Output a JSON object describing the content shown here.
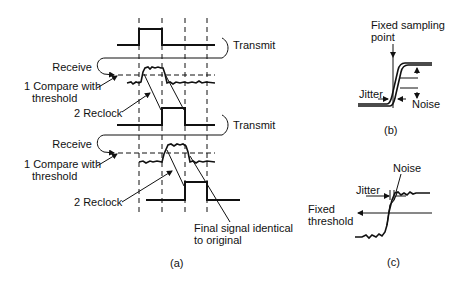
{
  "panel_a": {
    "caption": "(a)",
    "labels": {
      "transmit_1": "Transmit",
      "receive_1": "Receive",
      "compare_1_line1": "1 Compare with",
      "compare_1_line2": "threshold",
      "reclock_1": "2 Reclock",
      "transmit_2": "Transmit",
      "receive_2": "Receive",
      "compare_2_line1": "1 Compare with",
      "compare_2_line2": "threshold",
      "reclock_2": "2 Reclock",
      "final_line1": "Final signal identical",
      "final_line2": "to original"
    }
  },
  "panel_b": {
    "caption": "(b)",
    "labels": {
      "sampling_line1": "Fixed sampling",
      "sampling_line2": "point",
      "jitter": "Jitter",
      "noise": "Noise"
    }
  },
  "panel_c": {
    "caption": "(c)",
    "labels": {
      "noise": "Noise",
      "jitter": "Jitter",
      "threshold_line1": "Fixed",
      "threshold_line2": "threshold"
    }
  }
}
